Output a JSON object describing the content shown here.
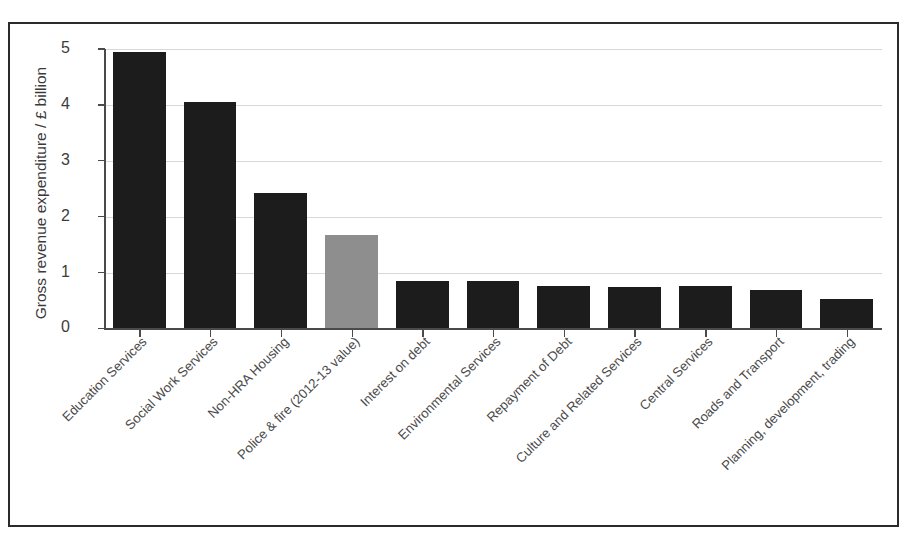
{
  "chart_data": {
    "type": "bar",
    "title": "",
    "subtitle": "",
    "xlabel": "",
    "ylabel": "Gross revenue expenditure / £ billion",
    "ylim": [
      0,
      5
    ],
    "yticks": [
      0,
      1,
      2,
      3,
      4,
      5
    ],
    "ytick_labels": [
      "0",
      "1",
      "2",
      "3",
      "4",
      "5"
    ],
    "grid": true,
    "legend": "none",
    "units": "£ billion",
    "bar_color": "#1c1c1c",
    "highlight_color": "#8e8e8e",
    "categories": [
      "Education Services",
      "Social Work Services",
      "Non-HRA Housing",
      "Police & fire (2012-13 value)",
      "Interest on debt",
      "Environmental Services",
      "Repayment of Debt",
      "Culture and Related Services",
      "Central Services",
      "Roads and Transport",
      "Planning, development, trading"
    ],
    "values": [
      4.95,
      4.05,
      2.42,
      1.67,
      0.85,
      0.85,
      0.76,
      0.74,
      0.76,
      0.68,
      0.53
    ],
    "highlighted_index": 3,
    "annotations": []
  },
  "axis": {
    "y_title": "Gross revenue expenditure / £ billion"
  }
}
